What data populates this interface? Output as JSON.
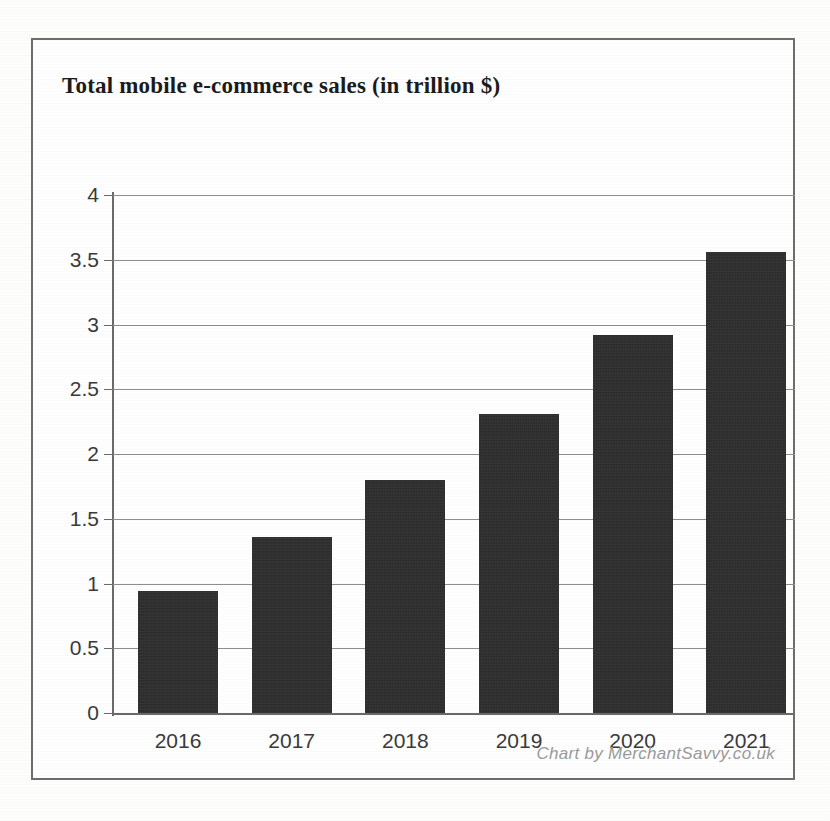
{
  "chart_data": {
    "type": "bar",
    "title": "Total mobile e-commerce sales (in trillion $)",
    "xlabel": "",
    "ylabel": "",
    "categories": [
      "2016",
      "2017",
      "2018",
      "2019",
      "2020",
      "2021"
    ],
    "values": [
      0.94,
      1.36,
      1.8,
      2.31,
      2.92,
      3.56
    ],
    "ylim": [
      0,
      4
    ],
    "ytick_labels": [
      "0",
      "0.5",
      "1",
      "1.5",
      "2",
      "2.5",
      "3",
      "3.5",
      "4"
    ],
    "ytick_values": [
      0,
      0.5,
      1,
      1.5,
      2,
      2.5,
      3,
      3.5,
      4
    ],
    "grid": true,
    "legend": false,
    "bar_color": "#2c2c2c",
    "grid_color": "#8d8d8d",
    "axis_color": "#6a6a6a",
    "series": [
      {
        "name": "Total mobile e-commerce sales",
        "unit": "trillion $",
        "values": [
          0.94,
          1.36,
          1.8,
          2.31,
          2.92,
          3.56
        ]
      }
    ]
  },
  "attribution": {
    "text": "Chart by MerchantSavvy.co.uk"
  },
  "page": {
    "background_color": "#fdfdfc",
    "frame_color": "#6d6d6d"
  }
}
